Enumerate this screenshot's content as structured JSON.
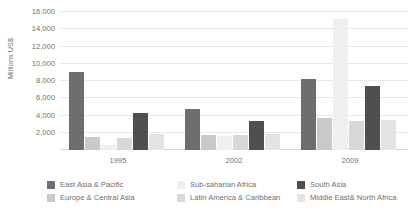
{
  "chart_data": {
    "type": "bar",
    "title": "",
    "subtitle": "",
    "xlabel": "",
    "ylabel": "Millions US$",
    "categories": [
      "1995",
      "2002",
      "2009"
    ],
    "ylim": [
      0,
      16000
    ],
    "yticks": [
      2000,
      4000,
      6000,
      8000,
      10000,
      12000,
      14000,
      16000
    ],
    "ytick_labels": [
      "2,000",
      "4,000",
      "6,000",
      "8,000",
      "10,000",
      "12,000",
      "14,000",
      "16,000"
    ],
    "grid": true,
    "legend_position": "bottom",
    "series": [
      {
        "name": "East Asia & Pacific",
        "color": "#6e6e6e",
        "values": [
          9100,
          4750,
          8250
        ]
      },
      {
        "name": "Europe & Central Asia",
        "color": "#c9c9c9",
        "values": [
          1500,
          1700,
          3700
        ]
      },
      {
        "name": "Sub-saharian Africa",
        "color": "#efefef",
        "values": [
          600,
          1650,
          15200
        ]
      },
      {
        "name": "Latin America & Caribbean",
        "color": "#d8d8d8",
        "values": [
          1350,
          1750,
          3400
        ]
      },
      {
        "name": "South Asia",
        "color": "#4f4f4f",
        "values": [
          4250,
          3350,
          7450
        ]
      },
      {
        "name": "Middle East& North Africa",
        "color": "#e3e3e3",
        "values": [
          1800,
          1850,
          3450
        ]
      }
    ]
  },
  "legend": {
    "columns": [
      {
        "items": [
          {
            "label": "East Asia & Pacific",
            "color": "#6e6e6e"
          },
          {
            "label": "Europe & Central Asia",
            "color": "#c9c9c9"
          }
        ]
      },
      {
        "items": [
          {
            "label": "Sub-saharian Africa",
            "color": "#efefef"
          },
          {
            "label": "Latin America & Caribbean",
            "color": "#d8d8d8"
          }
        ]
      },
      {
        "items": [
          {
            "label": "South Asia",
            "color": "#4f4f4f"
          },
          {
            "label": "Middle East& North Africa",
            "color": "#e3e3e3"
          }
        ]
      }
    ]
  },
  "colors": {
    "grid": "#e9e9e9",
    "axis": "#d7d7d7",
    "text": "#6f6f6f",
    "background": "#ffffff"
  }
}
